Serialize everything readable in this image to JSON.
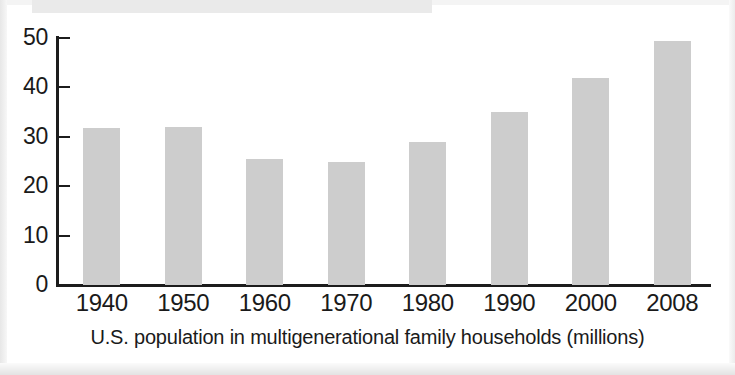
{
  "chart_data": {
    "type": "bar",
    "title": "",
    "subtitle": "",
    "caption": "U.S. population in multigenerational family households (millions)",
    "xlabel": "",
    "ylabel": "",
    "categories": [
      "1940",
      "1950",
      "1960",
      "1970",
      "1980",
      "1990",
      "2000",
      "2008"
    ],
    "values": [
      31.7,
      32.0,
      25.6,
      24.8,
      28.9,
      35.0,
      42.0,
      49.4
    ],
    "series": [
      {
        "name": "U.S. population in multigenerational family households (millions)",
        "values": [
          31.7,
          32.0,
          25.6,
          24.8,
          28.9,
          35.0,
          42.0,
          49.4
        ]
      }
    ],
    "ylim": [
      0,
      50
    ],
    "ytick_labels": [
      "0",
      "10",
      "20",
      "30",
      "40",
      "50"
    ],
    "ytick_values": [
      0,
      10,
      20,
      30,
      40,
      50
    ],
    "grid": false,
    "legend": false,
    "legend_position": "none",
    "bar_color": "#cdcdcd",
    "axis_color": "#1c1c1c",
    "background_color": "#ffffff"
  }
}
